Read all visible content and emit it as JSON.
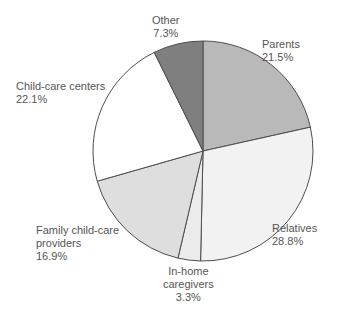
{
  "chart_data": {
    "type": "pie",
    "title": "",
    "subtitle": "",
    "xlabel": "",
    "ylabel": "",
    "legend_position": "none",
    "grid": false,
    "start_angle_deg": 0,
    "direction": "clockwise",
    "units": "percent",
    "categories": [
      "Parents",
      "Relatives",
      "In-home caregivers",
      "Family child-care providers",
      "Child-care centers",
      "Other"
    ],
    "values": [
      21.5,
      28.8,
      3.3,
      16.9,
      22.1,
      7.3
    ],
    "colors": [
      "#b9b9b9",
      "#f2f2f2",
      "#ebebeb",
      "#dedede",
      "#ffffff",
      "#7f7f7f"
    ],
    "slices": [
      {
        "name": "Parents",
        "value": 21.5,
        "value_label": "21.5%",
        "color": "#b9b9b9",
        "label_lines": [
          "Parents",
          "21.5%"
        ]
      },
      {
        "name": "Relatives",
        "value": 28.8,
        "value_label": "28.8%",
        "color": "#f2f2f2",
        "label_lines": [
          "Relatives",
          "28.8%"
        ]
      },
      {
        "name": "In-home caregivers",
        "value": 3.3,
        "value_label": "3.3%",
        "color": "#ebebeb",
        "label_lines": [
          "In-home",
          "caregivers",
          "3.3%"
        ]
      },
      {
        "name": "Family child-care providers",
        "value": 16.9,
        "value_label": "16.9%",
        "color": "#dedede",
        "label_lines": [
          "Family child-care",
          "providers",
          "16.9%"
        ]
      },
      {
        "name": "Child-care centers",
        "value": 22.1,
        "value_label": "22.1%",
        "color": "#ffffff",
        "label_lines": [
          "Child-care centers",
          "22.1%"
        ]
      },
      {
        "name": "Other",
        "value": 7.3,
        "value_label": "7.3%",
        "color": "#7f7f7f",
        "label_lines": [
          "Other",
          "7.3%"
        ]
      }
    ]
  },
  "labels": {
    "other": {
      "name": "Other",
      "value": "7.3%"
    },
    "parents": {
      "name": "Parents",
      "value": "21.5%"
    },
    "childcare_centers": {
      "name": "Child-care centers",
      "value": "22.1%"
    },
    "relatives": {
      "name": "Relatives",
      "value": "28.8%"
    },
    "family_providers": {
      "name_line1": "Family child-care",
      "name_line2": "providers",
      "value": "16.9%"
    },
    "inhome": {
      "name_line1": "In-home",
      "name_line2": "caregivers",
      "value": "3.3%"
    }
  },
  "style": {
    "outline_color": "#4d4d4d",
    "text_color": "#555555",
    "background": "#ffffff",
    "center_x": 203,
    "center_y": 151,
    "radius": 110
  }
}
